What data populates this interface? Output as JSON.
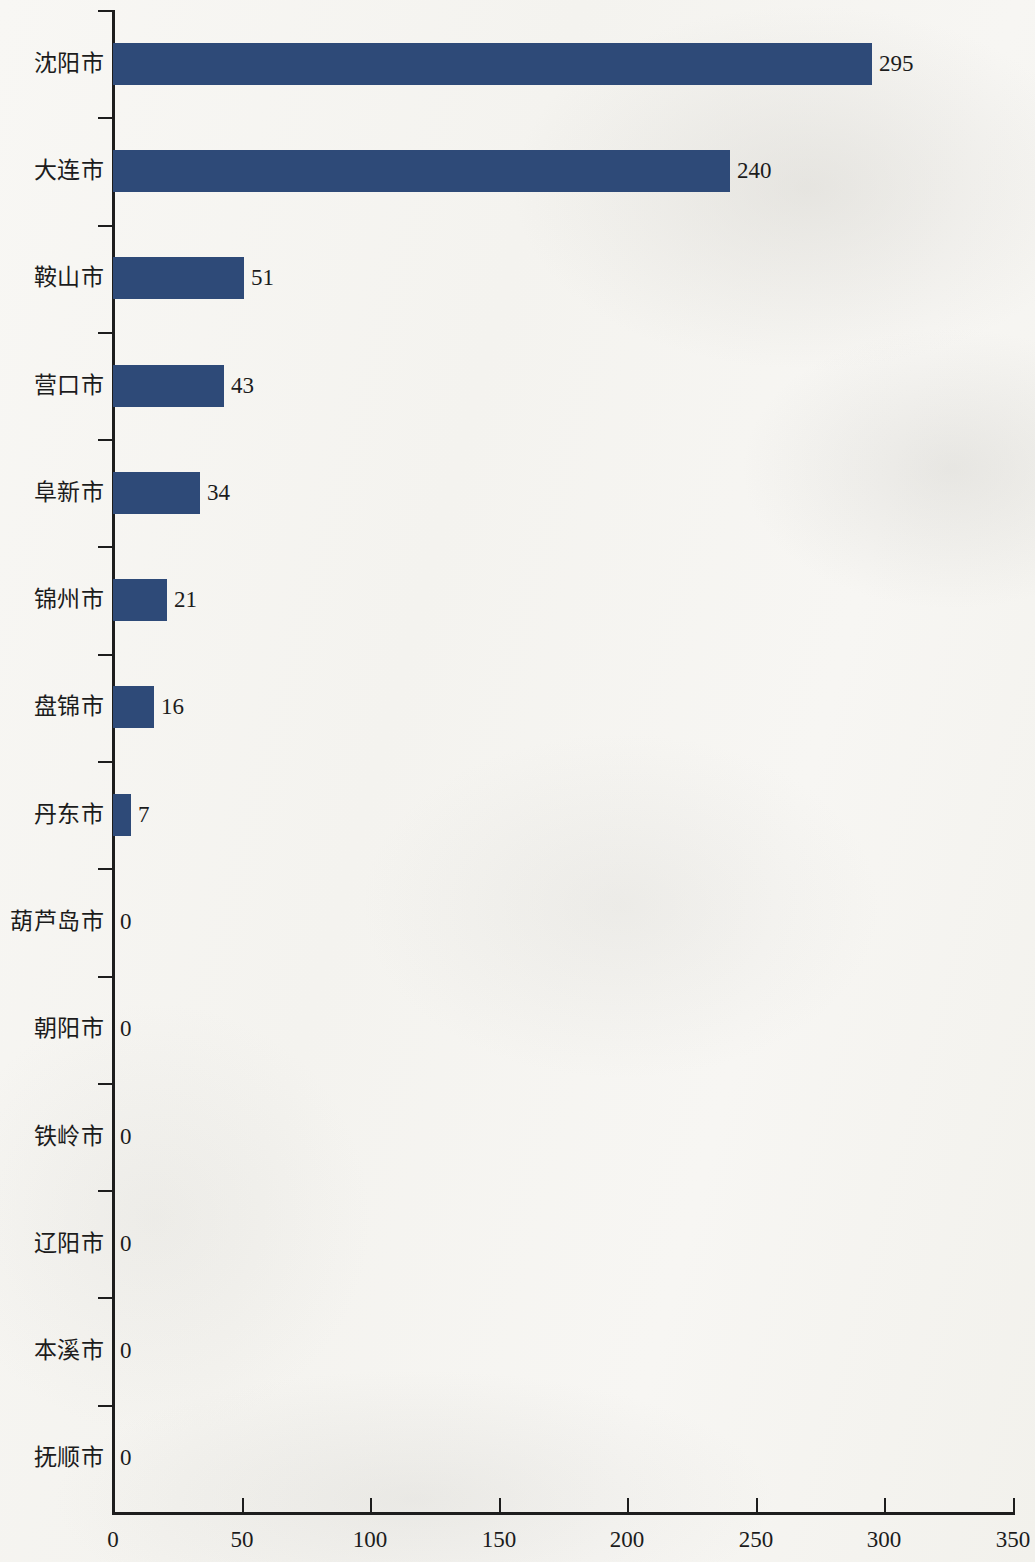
{
  "chart_data": {
    "type": "bar",
    "orientation": "horizontal",
    "title": "",
    "subtitle": "",
    "xlabel": "",
    "ylabel": "",
    "xlim": [
      0,
      350
    ],
    "x_ticks": [
      0,
      50,
      100,
      150,
      200,
      250,
      300,
      350
    ],
    "x_tick_labels": [
      "0",
      "50",
      "100",
      "150",
      "200",
      "250",
      "300",
      "350"
    ],
    "grid": false,
    "legend": false,
    "categories": [
      "沈阳市",
      "大连市",
      "鞍山市",
      "营口市",
      "阜新市",
      "锦州市",
      "盘锦市",
      "丹东市",
      "葫芦岛市",
      "朝阳市",
      "铁岭市",
      "辽阳市",
      "本溪市",
      "抚顺市"
    ],
    "values": [
      295,
      240,
      51,
      43,
      34,
      21,
      16,
      7,
      0,
      0,
      0,
      0,
      0,
      0
    ],
    "value_labels": [
      "295",
      "240",
      "51",
      "43",
      "34",
      "21",
      "16",
      "7",
      "0",
      "0",
      "0",
      "0",
      "0",
      "0"
    ],
    "series": [
      {
        "name": "数量",
        "values": [
          295,
          240,
          51,
          43,
          34,
          21,
          16,
          7,
          0,
          0,
          0,
          0,
          0,
          0
        ]
      }
    ],
    "bar_color": "#2e4a78",
    "axis_color": "#1d1d1d",
    "background_color": "#f6f5f2",
    "text_color": "#1c1c1c"
  }
}
